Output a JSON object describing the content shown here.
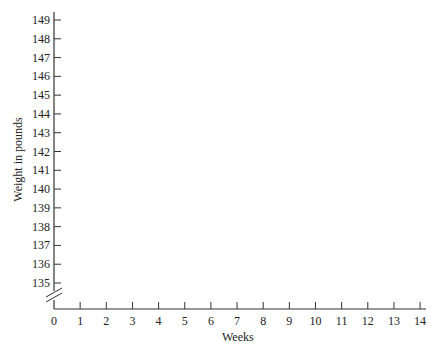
{
  "chart_data": {
    "type": "line",
    "title": "",
    "xlabel": "Weeks",
    "ylabel": "Weight in pounds",
    "x_ticks": [
      0,
      1,
      2,
      3,
      4,
      5,
      6,
      7,
      8,
      9,
      10,
      11,
      12,
      13,
      14
    ],
    "y_ticks": [
      135,
      136,
      137,
      138,
      139,
      140,
      141,
      142,
      143,
      144,
      145,
      146,
      147,
      148,
      149
    ],
    "xlim": [
      0,
      14
    ],
    "ylim": [
      135,
      149
    ],
    "y_axis_break": true,
    "grid": false,
    "series": []
  }
}
